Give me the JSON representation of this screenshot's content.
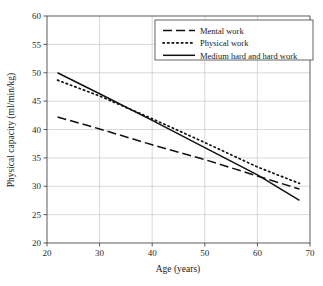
{
  "chart_data": {
    "type": "line",
    "title": "",
    "xlabel": "Age (years)",
    "ylabel": "Physical capacity (ml/min/kg)",
    "xlim": [
      20,
      70
    ],
    "ylim": [
      20,
      60
    ],
    "xticks": [
      20,
      30,
      40,
      50,
      60,
      70
    ],
    "yticks": [
      20,
      25,
      30,
      35,
      40,
      45,
      50,
      55,
      60
    ],
    "xtick_labels": [
      "20",
      "30",
      "40",
      "50",
      "60",
      "70"
    ],
    "ytick_labels": [
      "20",
      "25",
      "30",
      "35",
      "40",
      "45",
      "50",
      "55",
      "60"
    ],
    "grid": true,
    "legend_position": "top-right",
    "series": [
      {
        "name": "Mental work",
        "style": "dashed",
        "color": "#111111",
        "x": [
          22,
          30,
          40,
          50,
          60,
          68
        ],
        "values": [
          42.2,
          40.1,
          37.3,
          34.7,
          31.8,
          29.5
        ]
      },
      {
        "name": "Physical work",
        "style": "dotted",
        "color": "#111111",
        "x": [
          22,
          30,
          40,
          50,
          60,
          68
        ],
        "values": [
          48.7,
          45.9,
          41.9,
          37.7,
          33.4,
          30.5
        ]
      },
      {
        "name": "Medium hard and hard work",
        "style": "solid",
        "color": "#111111",
        "x": [
          22,
          30,
          40,
          50,
          60,
          68
        ],
        "values": [
          50.0,
          46.3,
          41.6,
          36.8,
          32.0,
          27.5
        ]
      }
    ]
  },
  "legend": {
    "items": [
      {
        "label": "Mental work",
        "style": "dashed"
      },
      {
        "label": "Physical work",
        "style": "dotted"
      },
      {
        "label": "Medium hard and hard work",
        "style": "solid"
      }
    ]
  }
}
